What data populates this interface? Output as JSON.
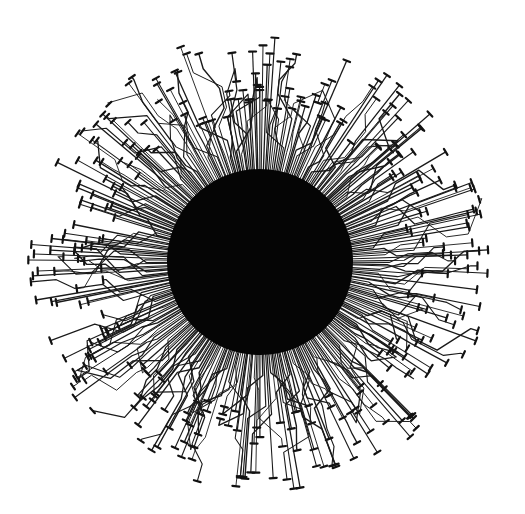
{
  "artwork": {
    "title": "Circuit sun",
    "description": "Black disc with radial circuit-board traces ending in terminal caps",
    "canvas": {
      "width": 525,
      "height": 514,
      "background": "#ffffff"
    },
    "disc": {
      "cx": 260,
      "cy": 262,
      "r": 93,
      "color": "#050505"
    },
    "traces": {
      "count": 340,
      "color": "#1a1a1a",
      "stroke_width": 1.1,
      "inner_radius": 88,
      "outer_radius_min": 150,
      "outer_radius_max": 232,
      "kink_probability": 0.72,
      "max_kink_offset_deg": 9,
      "cap_length": 7,
      "cap_width": 2.2,
      "cap_color": "#111111",
      "seed": 1337,
      "aspect_y": 0.99
    }
  }
}
